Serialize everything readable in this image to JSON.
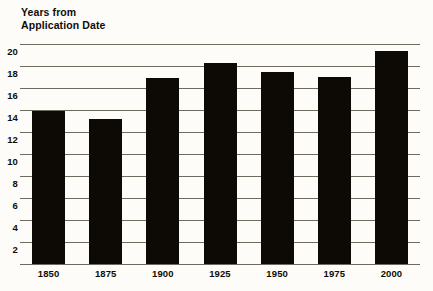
{
  "chart_data": {
    "type": "bar",
    "title": "Years from\nApplication Date",
    "xlabel": "",
    "ylabel": "Years from Application Date",
    "categories": [
      "1850",
      "1875",
      "1900",
      "1925",
      "1950",
      "1975",
      "2000"
    ],
    "values": [
      13.9,
      13.2,
      16.9,
      18.3,
      17.5,
      17.0,
      19.4
    ],
    "ylim": [
      0,
      20
    ],
    "y_ticks": [
      "20",
      "18",
      "16",
      "14",
      "12",
      "10",
      "8",
      "6",
      "4",
      "2"
    ],
    "y_tick_values": [
      20,
      18,
      16,
      14,
      12,
      10,
      8,
      6,
      4,
      2
    ],
    "grid": true,
    "legend": null,
    "bar_color": "#0d0a06",
    "grid_color": "#6f6a60",
    "background_color": "#fdfcf8"
  }
}
